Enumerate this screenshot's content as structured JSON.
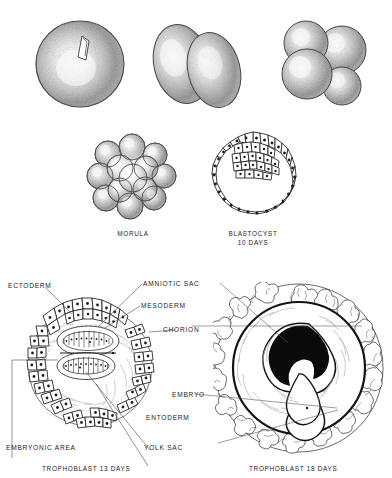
{
  "figure": {
    "background_color": "#ffffff",
    "ink_color": "#1b1b1b"
  },
  "stages": {
    "row1": [
      {
        "name": "fertilized-ovum",
        "label": "",
        "cells": 1
      },
      {
        "name": "two-cell-stage",
        "label": "",
        "cells": 2
      },
      {
        "name": "four-cell-stage",
        "label": "",
        "cells": 4
      }
    ],
    "row2": [
      {
        "name": "morula",
        "label": "MORULA",
        "sublabel": ""
      },
      {
        "name": "blastocyst",
        "label": "BLASTOCYST",
        "sublabel": "10  DAYS"
      }
    ],
    "row3": [
      {
        "name": "trophoblast-13-days",
        "label": "TROPHOBLAST  13 DAYS"
      },
      {
        "name": "trophoblast-18-days",
        "label": "TROPHOBLAST 18 DAYS"
      }
    ]
  },
  "annotations": {
    "ectoderm": "ECTODERM",
    "amniotic_sac": "AMNIOTIC SAC",
    "mesoderm": "MESODERM",
    "chorion": "CHORION",
    "embryo": "EMBRYO",
    "entoderm": "ENTODERM",
    "yolk_sac": "YOLK SAC",
    "embryonic_area": "EMBRYONIC AREA"
  },
  "captions": {
    "morula": "MORULA",
    "blastocyst": "BLASTOCYST",
    "blastocyst_days": "10  DAYS",
    "trophoblast13": "TROPHOBLAST  13 DAYS",
    "trophoblast18": "TROPHOBLAST 18 DAYS"
  }
}
